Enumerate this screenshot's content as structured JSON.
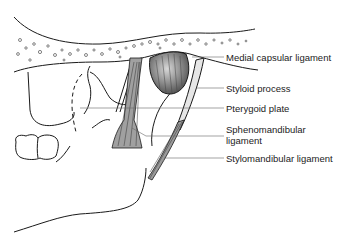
{
  "figure": {
    "colors": {
      "line": "#1a1a1a",
      "ligament_fill": "#9a9a9a",
      "capsule_fill": "#8c8c8c",
      "leader": "#666666",
      "text": "#222222"
    }
  },
  "labels": [
    {
      "id": "medial-capsular-ligament",
      "text": "Medial capsular ligament"
    },
    {
      "id": "styloid-process",
      "text": "Styloid process"
    },
    {
      "id": "pterygoid-plate",
      "text": "Pterygoid plate"
    },
    {
      "id": "sphenomandibular-ligament",
      "text": "Sphenomandibular",
      "text2": "ligament"
    },
    {
      "id": "stylomandibular-ligament",
      "text": "Stylomandibular ligament"
    }
  ]
}
